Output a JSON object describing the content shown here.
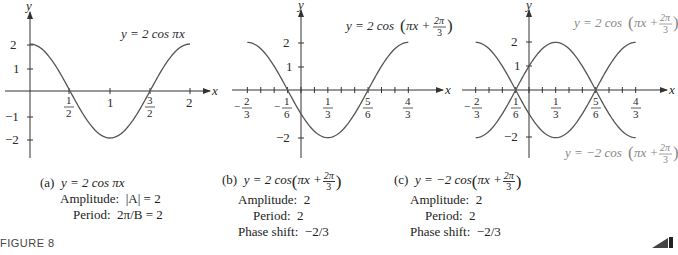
{
  "figure_label": "FIGURE 8",
  "panels": [
    {
      "id": "a",
      "equation_label": "y = 2 cos πx",
      "caption": {
        "tag": "(a)",
        "equation": "y = 2 cos πx",
        "amplitude_label": "Amplitude:",
        "amplitude_value": "|A| = 2",
        "period_label": "Period:",
        "period_value": "2π/B = 2"
      },
      "axis": {
        "x_label": "x",
        "y_label": "y"
      },
      "x_ticks": [
        "1/2",
        "1",
        "3/2",
        "2"
      ],
      "y_ticks": [
        "2",
        "1",
        "−1",
        "−2"
      ]
    },
    {
      "id": "b",
      "equation_label": "y = 2 cos(πx + 2π/3)",
      "caption": {
        "tag": "(b)",
        "equation_prefix": "y = 2 cos",
        "equation_inner": "πx +",
        "frac_num": "2π",
        "frac_den": "3",
        "amplitude_label": "Amplitude:",
        "amplitude_value": "2",
        "period_label": "Period:",
        "period_value": "2",
        "phase_label": "Phase shift:",
        "phase_value": "−2/3"
      },
      "axis": {
        "x_label": "x",
        "y_label": "y"
      },
      "x_ticks": [
        "−2/3",
        "−1/6",
        "1/3",
        "5/6",
        "4/3"
      ],
      "y_ticks": [
        "2",
        "1",
        "−2"
      ]
    },
    {
      "id": "c",
      "equation_label_top": "y = 2 cos(πx + 2π/3)",
      "equation_label_bottom": "y = −2 cos(πx + 2π/3)",
      "caption": {
        "tag": "(c)",
        "equation_prefix": "y = −2 cos",
        "equation_inner": "πx +",
        "frac_num": "2π",
        "frac_den": "3",
        "amplitude_label": "Amplitude:",
        "amplitude_value": "2",
        "period_label": "Period:",
        "period_value": "2",
        "phase_label": "Phase shift:",
        "phase_value": "−2/3"
      },
      "axis": {
        "x_label": "x",
        "y_label": "y"
      },
      "x_ticks": [
        "−2/3",
        "1/6",
        "1/3",
        "5/6",
        "4/3"
      ],
      "y_ticks": [
        "2",
        "1",
        "−2"
      ]
    }
  ],
  "text": {
    "eq_a": "y = 2 cos πx",
    "eq_prefix_pos": "y = 2 cos",
    "eq_prefix_neg": "y = −2 cos",
    "eq_inner": "πx +",
    "two_pi": "2π",
    "three": "3",
    "x": "x",
    "y": "y",
    "t_half": "1",
    "t_two": "2",
    "t_one": "1",
    "t_neg1": "−1",
    "t_neg2": "−2",
    "t_three": "3",
    "t_six": "6",
    "t_five": "5",
    "t_four": "4",
    "minus": "−"
  },
  "chart_data": [
    {
      "type": "line",
      "title": "(a) y = 2 cos πx",
      "xlabel": "x",
      "ylabel": "y",
      "x_tick_labels": [
        "1/2",
        "1",
        "3/2",
        "2"
      ],
      "y_tick_labels": [
        "2",
        "1",
        "−1",
        "−2"
      ],
      "xlim": [
        0,
        2
      ],
      "ylim": [
        -2,
        2
      ],
      "series": [
        {
          "name": "y = 2 cos πx",
          "x": [
            0,
            0.5,
            1,
            1.5,
            2
          ],
          "y": [
            2,
            0,
            -2,
            0,
            2
          ]
        }
      ],
      "annotations": [
        "Amplitude: |A| = 2",
        "Period: 2π/B = 2"
      ]
    },
    {
      "type": "line",
      "title": "(b) y = 2 cos(πx + 2π/3)",
      "xlabel": "x",
      "ylabel": "y",
      "x_tick_labels": [
        "−2/3",
        "−1/6",
        "1/3",
        "5/6",
        "4/3"
      ],
      "y_tick_labels": [
        "2",
        "1",
        "−2"
      ],
      "xlim": [
        -0.6667,
        1.3333
      ],
      "ylim": [
        -2,
        2
      ],
      "series": [
        {
          "name": "y = 2 cos(πx + 2π/3)",
          "x": [
            -0.6667,
            -0.1667,
            0,
            0.3333,
            0.8333,
            1.3333
          ],
          "y": [
            2,
            0,
            -1,
            -2,
            0,
            2
          ]
        }
      ],
      "annotations": [
        "Amplitude: 2",
        "Period: 2",
        "Phase shift: −2/3"
      ]
    },
    {
      "type": "line",
      "title": "(c) y = −2 cos(πx + 2π/3)",
      "xlabel": "x",
      "ylabel": "y",
      "x_tick_labels": [
        "−2/3",
        "1/6",
        "1/3",
        "5/6",
        "4/3"
      ],
      "y_tick_labels": [
        "2",
        "1",
        "−2"
      ],
      "xlim": [
        -0.6667,
        1.3333
      ],
      "ylim": [
        -2,
        2
      ],
      "series": [
        {
          "name": "y = 2 cos(πx + 2π/3)",
          "x": [
            -0.6667,
            -0.1667,
            0,
            0.3333,
            0.8333,
            1.3333
          ],
          "y": [
            2,
            0,
            -1,
            -2,
            0,
            2
          ]
        },
        {
          "name": "y = −2 cos(πx + 2π/3)",
          "x": [
            -0.6667,
            -0.1667,
            0,
            0.3333,
            0.8333,
            1.3333
          ],
          "y": [
            -2,
            0,
            1,
            2,
            0,
            -2
          ]
        }
      ],
      "annotations": [
        "Amplitude: 2",
        "Period: 2",
        "Phase shift: −2/3"
      ]
    }
  ]
}
